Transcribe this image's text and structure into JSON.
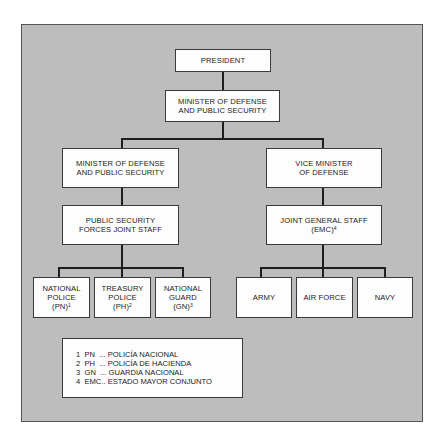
{
  "chart": {
    "nodes": {
      "president": {
        "lines": [
          "PRESIDENT"
        ]
      },
      "minister_top": {
        "lines": [
          "MINISTER OF DEFENSE",
          "AND PUBLIC SECURITY"
        ]
      },
      "minister_left": {
        "lines": [
          "MINISTER OF DEFENSE",
          "AND PUBLIC SECURITY"
        ]
      },
      "vice_minister": {
        "lines": [
          "VICE MINISTER",
          "OF DEFENSE"
        ]
      },
      "ps_forces": {
        "lines": [
          "PUBLIC SECURITY",
          "FORCES JOINT STAFF"
        ]
      },
      "joint_general": {
        "lines": [
          "JOINT GENERAL STAFF",
          "(EMC)"
        ],
        "sup": "4"
      },
      "national_police": {
        "lines": [
          "NATIONAL",
          "POLICE",
          "(PN)"
        ],
        "sup": "1"
      },
      "treasury_police": {
        "lines": [
          "TREASURY",
          "POLICE",
          "(PH)"
        ],
        "sup": "2"
      },
      "national_guard": {
        "lines": [
          "NATIONAL",
          "GUARD",
          "(GN)"
        ],
        "sup": "3"
      },
      "army": {
        "lines": [
          "ARMY"
        ]
      },
      "air_force": {
        "lines": [
          "AIR FORCE"
        ]
      },
      "navy": {
        "lines": [
          "NAVY"
        ]
      }
    },
    "legend": [
      {
        "num": "1",
        "abbr": "PN",
        "sep": "  ...",
        "text": "POLICÍA NACIONAL"
      },
      {
        "num": "2",
        "abbr": "PH",
        "sep": "  ...",
        "text": "POLICÍA DE HACIENDA"
      },
      {
        "num": "3",
        "abbr": "GN",
        "sep": "  ...",
        "text": "GUARDIA NACIONAL"
      },
      {
        "num": "4",
        "abbr": "EMC",
        "sep": "..",
        "text": "ESTADO MAYOR CONJUNTO"
      }
    ],
    "colors": {
      "background": "#bdbdbd",
      "box": "#fdfdfd",
      "line": "#1e1e1e"
    }
  }
}
